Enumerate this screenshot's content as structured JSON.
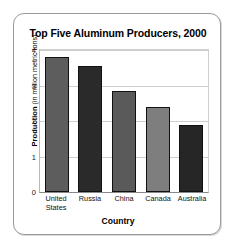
{
  "chart_data": {
    "type": "bar",
    "title": "Top Five Aluminum Producers, 2000",
    "xlabel": "Country",
    "ylabel": "Production (in million metric tons)",
    "ylabel_bold_part": "Production",
    "ylabel_rest": " (in million metric tons)",
    "categories": [
      "United States",
      "Russia",
      "China",
      "Canada",
      "Australia"
    ],
    "category_lines": [
      [
        "United",
        "States"
      ],
      [
        "Russia"
      ],
      [
        "China"
      ],
      [
        "Canada"
      ],
      [
        "Australia"
      ]
    ],
    "values": [
      3.8,
      3.55,
      2.85,
      2.4,
      1.9
    ],
    "bar_colors": [
      "#5d5d5d",
      "#2a2a2a",
      "#5a5a5a",
      "#7e7e7e",
      "#262626"
    ],
    "ylim": [
      0,
      4
    ],
    "yticks": [
      0,
      1,
      2,
      3,
      4
    ],
    "ytick_labels": [
      "0",
      "1",
      "2",
      "3",
      "4"
    ],
    "grid": true,
    "legend": "none"
  }
}
